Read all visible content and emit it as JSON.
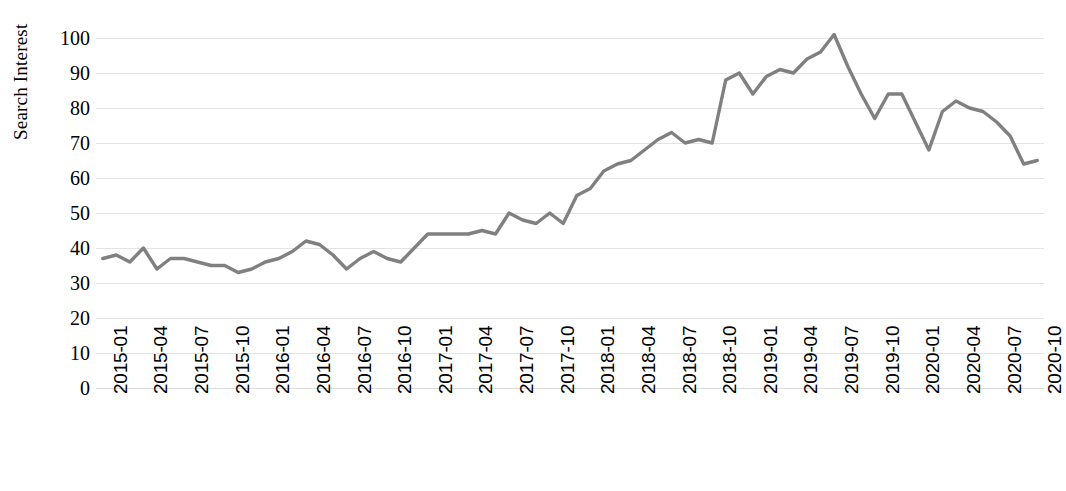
{
  "chart_data": {
    "type": "line",
    "title": "",
    "xlabel": "",
    "ylabel": "Search Interest",
    "ylim": [
      0,
      100
    ],
    "ytick_labels": [
      "100",
      "90",
      "80",
      "70",
      "60",
      "50",
      "40",
      "30",
      "20",
      "10",
      "0"
    ],
    "ytick_values": [
      100,
      90,
      80,
      70,
      60,
      50,
      40,
      30,
      20,
      10,
      0
    ],
    "grid": true,
    "legend": "none",
    "line_color": "#808080",
    "grid_color": "#e4e4e4",
    "xtick_labels": [
      "2015-01",
      "2015-04",
      "2015-07",
      "2015-10",
      "2016-01",
      "2016-04",
      "2016-07",
      "2016-10",
      "2017-01",
      "2017-04",
      "2017-07",
      "2017-10",
      "2018-01",
      "2018-04",
      "2018-07",
      "2018-10",
      "2019-01",
      "2019-04",
      "2019-07",
      "2019-10",
      "2020-01",
      "2020-04",
      "2020-07",
      "2020-10"
    ],
    "x": [
      "2015-01",
      "2015-02",
      "2015-03",
      "2015-04",
      "2015-05",
      "2015-06",
      "2015-07",
      "2015-08",
      "2015-09",
      "2015-10",
      "2015-11",
      "2015-12",
      "2016-01",
      "2016-02",
      "2016-03",
      "2016-04",
      "2016-05",
      "2016-06",
      "2016-07",
      "2016-08",
      "2016-09",
      "2016-10",
      "2016-11",
      "2016-12",
      "2017-01",
      "2017-02",
      "2017-03",
      "2017-04",
      "2017-05",
      "2017-06",
      "2017-07",
      "2017-08",
      "2017-09",
      "2017-10",
      "2017-11",
      "2017-12",
      "2018-01",
      "2018-02",
      "2018-03",
      "2018-04",
      "2018-05",
      "2018-06",
      "2018-07",
      "2018-08",
      "2018-09",
      "2018-10",
      "2018-11",
      "2018-12",
      "2019-01",
      "2019-02",
      "2019-03",
      "2019-04",
      "2019-05",
      "2019-06",
      "2019-07",
      "2019-08",
      "2019-09",
      "2019-10",
      "2019-11",
      "2019-12",
      "2020-01",
      "2020-02",
      "2020-03",
      "2020-04",
      "2020-05",
      "2020-06",
      "2020-07",
      "2020-08",
      "2020-09",
      "2020-10"
    ],
    "values": [
      37,
      38,
      36,
      40,
      34,
      37,
      37,
      36,
      35,
      35,
      33,
      34,
      36,
      37,
      39,
      42,
      41,
      38,
      34,
      37,
      39,
      37,
      36,
      40,
      44,
      44,
      44,
      44,
      45,
      44,
      50,
      48,
      47,
      50,
      47,
      55,
      57,
      62,
      64,
      65,
      68,
      71,
      73,
      70,
      71,
      70,
      88,
      90,
      84,
      89,
      91,
      90,
      94,
      96,
      101,
      92,
      84,
      77,
      84,
      84,
      76,
      68,
      79,
      82,
      80,
      79,
      76,
      72,
      64,
      65
    ]
  }
}
